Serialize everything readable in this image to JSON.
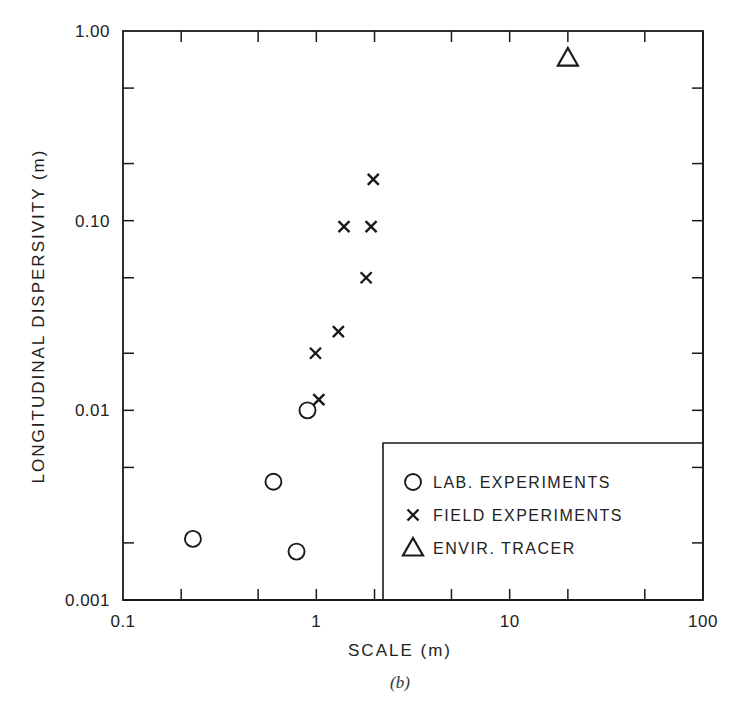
{
  "chart_data": {
    "type": "scatter",
    "title": "",
    "caption": "(b)",
    "xlabel": "SCALE (m)",
    "ylabel": "LONGITUDINAL DISPERSIVITY (m)",
    "xscale": "log",
    "yscale": "log",
    "xlim": [
      0.1,
      100
    ],
    "ylim": [
      0.001,
      1.0
    ],
    "x_tick_labels": [
      "0.1",
      "1",
      "10",
      "100"
    ],
    "y_tick_labels": [
      "0.001",
      "0.01",
      "0.10",
      "1.00"
    ],
    "grid": false,
    "legend_position": "lower right (boxed)",
    "series": [
      {
        "name": "LAB. EXPERIMENTS",
        "marker": "circle",
        "points": [
          {
            "x": 0.23,
            "y": 0.0021
          },
          {
            "x": 0.6,
            "y": 0.0042
          },
          {
            "x": 0.79,
            "y": 0.0018
          },
          {
            "x": 0.9,
            "y": 0.01
          }
        ]
      },
      {
        "name": "FIELD EXPERIMENTS",
        "marker": "x",
        "points": [
          {
            "x": 1.03,
            "y": 0.0114
          },
          {
            "x": 0.99,
            "y": 0.02
          },
          {
            "x": 1.3,
            "y": 0.026
          },
          {
            "x": 1.81,
            "y": 0.05
          },
          {
            "x": 1.39,
            "y": 0.093
          },
          {
            "x": 1.92,
            "y": 0.093
          },
          {
            "x": 1.97,
            "y": 0.165
          }
        ]
      },
      {
        "name": "ENVIR. TRACER",
        "marker": "triangle",
        "points": [
          {
            "x": 20,
            "y": 0.72
          }
        ]
      }
    ]
  },
  "legend": {
    "items": [
      {
        "marker": "circle",
        "label": "LAB. EXPERIMENTS"
      },
      {
        "marker": "x",
        "label": "FIELD EXPERIMENTS"
      },
      {
        "marker": "triangle",
        "label": "ENVIR. TRACER"
      }
    ]
  },
  "colors": {
    "ink": "#1a1a1a",
    "background": "#ffffff"
  }
}
